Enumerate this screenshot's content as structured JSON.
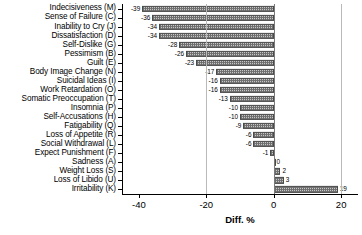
{
  "chart_data": {
    "type": "bar",
    "orientation": "horizontal",
    "title": "",
    "subtitle": "",
    "xlabel": "Diff. %",
    "ylabel": "",
    "xlim": [
      -45,
      25
    ],
    "xticks": [
      -40,
      -20,
      0,
      20
    ],
    "xtick_labels": [
      "-40",
      "-20",
      "0",
      "20"
    ],
    "grid": "vertical-light",
    "legend": "none",
    "categories": [
      "Indecisiveness (M)",
      "Sense of Failure (C)",
      "Inability to Cry (J)",
      "Dissatisfaction (D)",
      "Self-Dislike (G)",
      "Pessimism (B)",
      "Guilt (E)",
      "Body Image Change (N)",
      "Suicidal Ideas (I)",
      "Work Retardation (O)",
      "Somatic Preoccupation (T)",
      "Insomnia (P)",
      "Self-Accusations (H)",
      "Fatigability (Q)",
      "Loss of Appetite (R)",
      "Social Withdrawal (L)",
      "Expect Punishment (F)",
      "Sadness (A)",
      "Weight Loss (S)",
      "Loss of Libido (U)",
      "Irritability (K)"
    ],
    "values": [
      -39,
      -36,
      -34,
      -34,
      -28,
      -26,
      -23,
      -17,
      -16,
      -16,
      -13,
      -10,
      -10,
      -9,
      -6,
      -6,
      -1,
      0,
      2,
      3,
      19
    ],
    "value_labels": [
      "-39",
      "-36",
      "-34",
      "-34",
      "-28",
      "-26",
      "-23",
      "-17",
      "-16",
      "-16",
      "-13",
      "-10",
      "-10",
      "-9",
      "-6",
      "-6",
      "-1",
      "0",
      "2",
      "3",
      "19"
    ]
  },
  "axis": {
    "x_title": "Diff. %"
  }
}
